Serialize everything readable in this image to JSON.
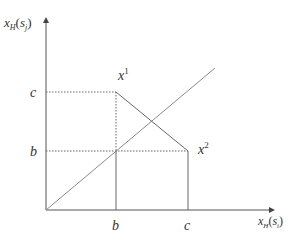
{
  "diagram": {
    "axes": {
      "y_label": {
        "main": "x",
        "sub": "H",
        "paren_open": "(",
        "arg": "s",
        "arg_sub": "j",
        "paren_close": ")"
      },
      "x_label": {
        "main": "x",
        "sub": "H",
        "paren_open": "(",
        "arg": "s",
        "arg_sub": "i",
        "paren_close": ")"
      }
    },
    "ticks": {
      "y": [
        {
          "label": "c"
        },
        {
          "label": "b"
        }
      ],
      "x": [
        {
          "label": "b"
        },
        {
          "label": "c"
        }
      ]
    },
    "points": [
      {
        "label": "x",
        "sup": "1",
        "coords": "(b, c)"
      },
      {
        "label": "x",
        "sup": "2",
        "coords": "(c, b)"
      }
    ],
    "lines": {
      "diagonal": "45-degree line",
      "segment": "x1 to x2"
    },
    "colors": {
      "axis": "#555555",
      "lines": "#666666",
      "diagonal": "#8a8a8a",
      "text": "#333333"
    }
  }
}
